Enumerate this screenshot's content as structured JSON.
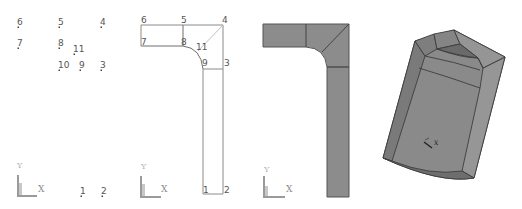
{
  "figure": {
    "panels": [
      {
        "id": "keypoints",
        "title": "Keypoints",
        "keypoints": [
          {
            "label": "6",
            "x": 18,
            "y": 27
          },
          {
            "label": "5",
            "x": 59,
            "y": 27
          },
          {
            "label": "4",
            "x": 101,
            "y": 27
          },
          {
            "label": "7",
            "x": 18,
            "y": 48
          },
          {
            "label": "8",
            "x": 59,
            "y": 48
          },
          {
            "label": "11",
            "x": 74,
            "y": 54
          },
          {
            "label": "10",
            "x": 59,
            "y": 70
          },
          {
            "label": "9",
            "x": 80,
            "y": 70
          },
          {
            "label": "3",
            "x": 101,
            "y": 70
          },
          {
            "label": "1",
            "x": 81,
            "y": 196
          },
          {
            "label": "2",
            "x": 102,
            "y": 196
          }
        ],
        "triad": {
          "x_label": "X",
          "y_label": "Y"
        }
      },
      {
        "id": "lines",
        "title": "Lines",
        "labels": [
          {
            "label": "6",
            "x": 141,
            "y": 23
          },
          {
            "label": "5",
            "x": 181,
            "y": 23
          },
          {
            "label": "4",
            "x": 222,
            "y": 23
          },
          {
            "label": "7",
            "x": 141,
            "y": 45
          },
          {
            "label": "8",
            "x": 181,
            "y": 45
          },
          {
            "label": "11",
            "x": 196,
            "y": 50
          },
          {
            "label": "9",
            "x": 202,
            "y": 66
          },
          {
            "label": "3",
            "x": 224,
            "y": 66
          },
          {
            "label": "1",
            "x": 203,
            "y": 193
          },
          {
            "label": "2",
            "x": 224,
            "y": 193
          }
        ],
        "triad": {
          "x_label": "X",
          "y_label": "Y"
        }
      },
      {
        "id": "areas",
        "title": "Areas",
        "fill_color": "#8c8c8c",
        "edge_color": "#555555",
        "triad": {
          "x_label": "X",
          "y_label": "Y"
        }
      },
      {
        "id": "volume",
        "title": "Volume",
        "fill_color": "#8a8a8a",
        "edge_color": "#3d3d3d",
        "triad": {
          "x_label": "X"
        }
      }
    ]
  }
}
